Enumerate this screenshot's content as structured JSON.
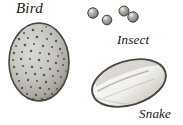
{
  "plate": {
    "title": "Egg types",
    "background_color": "#ffffff",
    "width": 183,
    "height": 125
  },
  "labels": {
    "bird": "Bird",
    "insect": "Insect",
    "snake": "Snake"
  },
  "specimens": [
    {
      "id": "bird-egg",
      "label": "Bird",
      "shape": "oval",
      "count": 1,
      "description": "Large speckled oval egg with dark brown spots on pale grey ground",
      "fill_color": "#c9c7c2",
      "outline_color": "#3b3631",
      "speckle_color": "#4a4440"
    },
    {
      "id": "insect-eggs",
      "label": "Insect",
      "shape": "sphere",
      "count": 4,
      "description": "Four tiny round grey eggs, two of them touching",
      "fill_color": "#9c9a95",
      "outline_color": "#4a4640",
      "highlight_color": "#dedcd7"
    },
    {
      "id": "snake-egg",
      "label": "Snake",
      "shape": "elongated-oval",
      "count": 1,
      "description": "Pale elongated leathery egg tilted, shaded outline",
      "fill_color": "#f4f2ee",
      "outline_color": "#555049",
      "shade_color": "#b9b5ae"
    }
  ],
  "text_color": "#1a1614"
}
